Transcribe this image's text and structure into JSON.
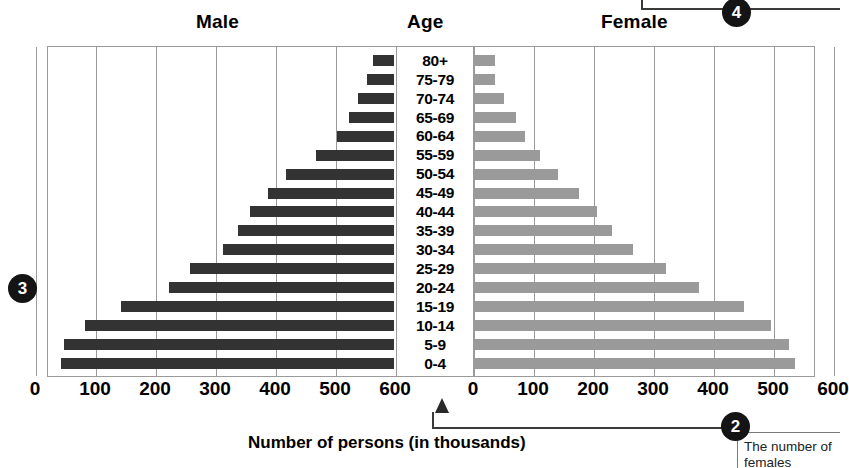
{
  "headers": {
    "male": "Male",
    "age": "Age",
    "female": "Female"
  },
  "axis_title": "Number of persons (in thousands)",
  "ticks_left": [
    "600",
    "500",
    "400",
    "300",
    "200",
    "100",
    "0"
  ],
  "ticks_right": [
    "0",
    "100",
    "200",
    "300",
    "400",
    "500",
    "600"
  ],
  "callouts": {
    "marker_left": "3",
    "marker_bottom": "2",
    "marker_top": "4",
    "note_text": "The number of females"
  },
  "colors": {
    "male_bar": "#333333",
    "female_bar": "#9a9a9a",
    "grid": "#9a9a9a",
    "marker": "#141414"
  },
  "chart_data": {
    "type": "bar",
    "subtype": "population-pyramid",
    "xlabel": "Number of persons (in thousands)",
    "ylabel": "Age",
    "xlim": [
      0,
      600
    ],
    "xticks": [
      0,
      100,
      200,
      300,
      400,
      500,
      600
    ],
    "grid": true,
    "legend": false,
    "categories": [
      "80+",
      "75-79",
      "70-74",
      "65-69",
      "60-64",
      "55-59",
      "50-54",
      "45-49",
      "40-44",
      "35-39",
      "30-34",
      "25-29",
      "20-24",
      "15-19",
      "10-14",
      "5-9",
      "0-4"
    ],
    "series": [
      {
        "name": "Male",
        "direction": "left",
        "color": "#333333",
        "values": [
          35,
          45,
          60,
          75,
          95,
          130,
          180,
          210,
          240,
          260,
          285,
          340,
          375,
          455,
          515,
          550,
          555
        ]
      },
      {
        "name": "Female",
        "direction": "right",
        "color": "#9a9a9a",
        "values": [
          35,
          35,
          50,
          70,
          85,
          110,
          140,
          175,
          205,
          230,
          265,
          320,
          375,
          450,
          495,
          525,
          535
        ]
      }
    ]
  }
}
